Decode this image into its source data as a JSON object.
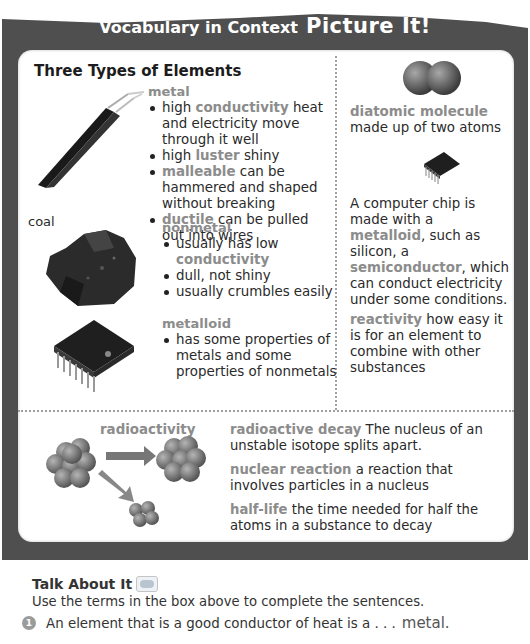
{
  "header": {
    "title_part1": "Vocabulary in Context",
    "title_part2": "Picture It!"
  },
  "section": {
    "title": "Three Types of Elements"
  },
  "metal": {
    "heading": "metal",
    "items": [
      {
        "term": "conductivity",
        "prefix": "high ",
        "definition": " heat and electricity move through it well"
      },
      {
        "term": "luster",
        "prefix": "high ",
        "definition": "  shiny"
      },
      {
        "term": "malleable",
        "prefix": "",
        "definition": "  can be hammered and shaped without breaking"
      },
      {
        "term": "ductile",
        "prefix": "",
        "definition": "  can be pulled out into wires"
      }
    ],
    "image_label": "metal wire"
  },
  "nonmetal": {
    "heading": "nonmetal",
    "image_label": "coal",
    "items": [
      {
        "prefix": "usually has low ",
        "term": "conductivity",
        "definition": ""
      },
      {
        "prefix": "dull, not shiny",
        "term": "",
        "definition": ""
      },
      {
        "prefix": "usually crumbles easily",
        "term": "",
        "definition": ""
      }
    ]
  },
  "metalloid": {
    "heading": "metalloid",
    "items": [
      {
        "prefix": "has some properties of metals and some properties of nonmetals",
        "term": "",
        "definition": ""
      }
    ]
  },
  "right_column": {
    "diatomic": {
      "term": "diatomic molecule",
      "definition": "made up of two atoms"
    },
    "chip": {
      "text1": "A computer chip is made with a ",
      "term1": "metalloid",
      "text2": ", such as silicon, a ",
      "term2": "semiconductor",
      "text3": ", which can conduct electricity under some conditions."
    },
    "reactivity": {
      "term": "reactivity",
      "definition": "  how easy it is for an element to combine with other substances"
    }
  },
  "bottom": {
    "radio_label": "radioactivity",
    "terms": [
      {
        "term": "radioactive decay",
        "definition": "  The nucleus of an unstable isotope splits apart."
      },
      {
        "term": "nuclear reaction",
        "definition": "  a reaction that involves particles in a nucleus"
      },
      {
        "term": "half-life",
        "definition": "  the time needed for half the atoms in a substance to decay"
      }
    ]
  },
  "talk": {
    "title": "Talk About It",
    "icon": "speech-bubbles-icon",
    "instructions": "Use the terms in the box above to complete the sentences.",
    "questions": [
      {
        "number": "1",
        "text": "An element that is a good conductor of heat is a . . . ",
        "answer": "metal."
      }
    ]
  },
  "colors": {
    "frame": "#4f4f4f",
    "term": "#8c8c8c",
    "body_text": "#2a2a2a"
  }
}
